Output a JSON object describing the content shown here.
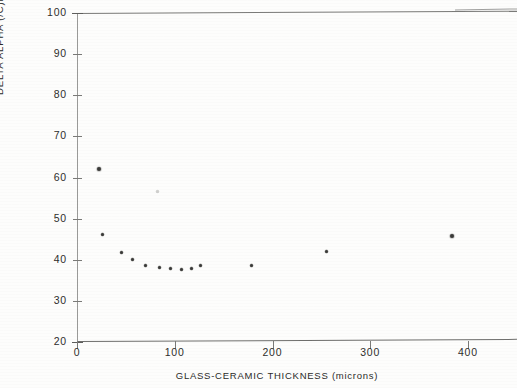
{
  "chart_data": {
    "type": "scatter",
    "title": "",
    "xlabel": "GLASS-CERAMIC THICKNESS (microns)",
    "ylabel": "DELTA ALPHA (/C)E-7",
    "xlim": [
      0,
      450
    ],
    "ylim": [
      20,
      100
    ],
    "xticks": [
      0,
      100,
      200,
      300,
      400
    ],
    "xtick_labels": [
      "0",
      "100",
      "200",
      "300",
      "400"
    ],
    "yticks": [
      20,
      30,
      40,
      50,
      60,
      70,
      80,
      90,
      100
    ],
    "ytick_labels": [
      "20",
      "30",
      "40",
      "50",
      "60",
      "70",
      "80",
      "90",
      "100"
    ],
    "grid": false,
    "legend": null,
    "marker": "+",
    "points": [
      {
        "x": 22,
        "y": 62.0,
        "faint": false
      },
      {
        "x": 26,
        "y": 46.2,
        "faint": false
      },
      {
        "x": 46,
        "y": 41.8,
        "faint": false
      },
      {
        "x": 57,
        "y": 40.0,
        "faint": false
      },
      {
        "x": 70,
        "y": 38.6,
        "faint": false
      },
      {
        "x": 82,
        "y": 56.5,
        "faint": true
      },
      {
        "x": 84,
        "y": 38.0,
        "faint": false
      },
      {
        "x": 96,
        "y": 37.9,
        "faint": false
      },
      {
        "x": 107,
        "y": 37.6,
        "faint": false
      },
      {
        "x": 117,
        "y": 37.8,
        "faint": false
      },
      {
        "x": 126,
        "y": 38.6,
        "faint": false
      },
      {
        "x": 179,
        "y": 38.7,
        "faint": false
      },
      {
        "x": 255,
        "y": 41.9,
        "faint": false
      },
      {
        "x": 384,
        "y": 45.8,
        "faint": false
      }
    ],
    "series": [
      {
        "name": "Delta Alpha vs Glass-Ceramic Thickness",
        "x": [
          22,
          26,
          46,
          57,
          70,
          82,
          84,
          96,
          107,
          117,
          126,
          179,
          255,
          384
        ],
        "values": [
          62.0,
          46.2,
          41.8,
          40.0,
          38.6,
          56.5,
          38.0,
          37.9,
          37.6,
          37.8,
          38.6,
          38.7,
          41.9,
          45.8
        ]
      }
    ]
  },
  "colors": {
    "ink": "#3a3a38",
    "axis": "#6e6e6c",
    "faint_ink": "#cfcfcd",
    "paper": "#fdfdfc"
  }
}
